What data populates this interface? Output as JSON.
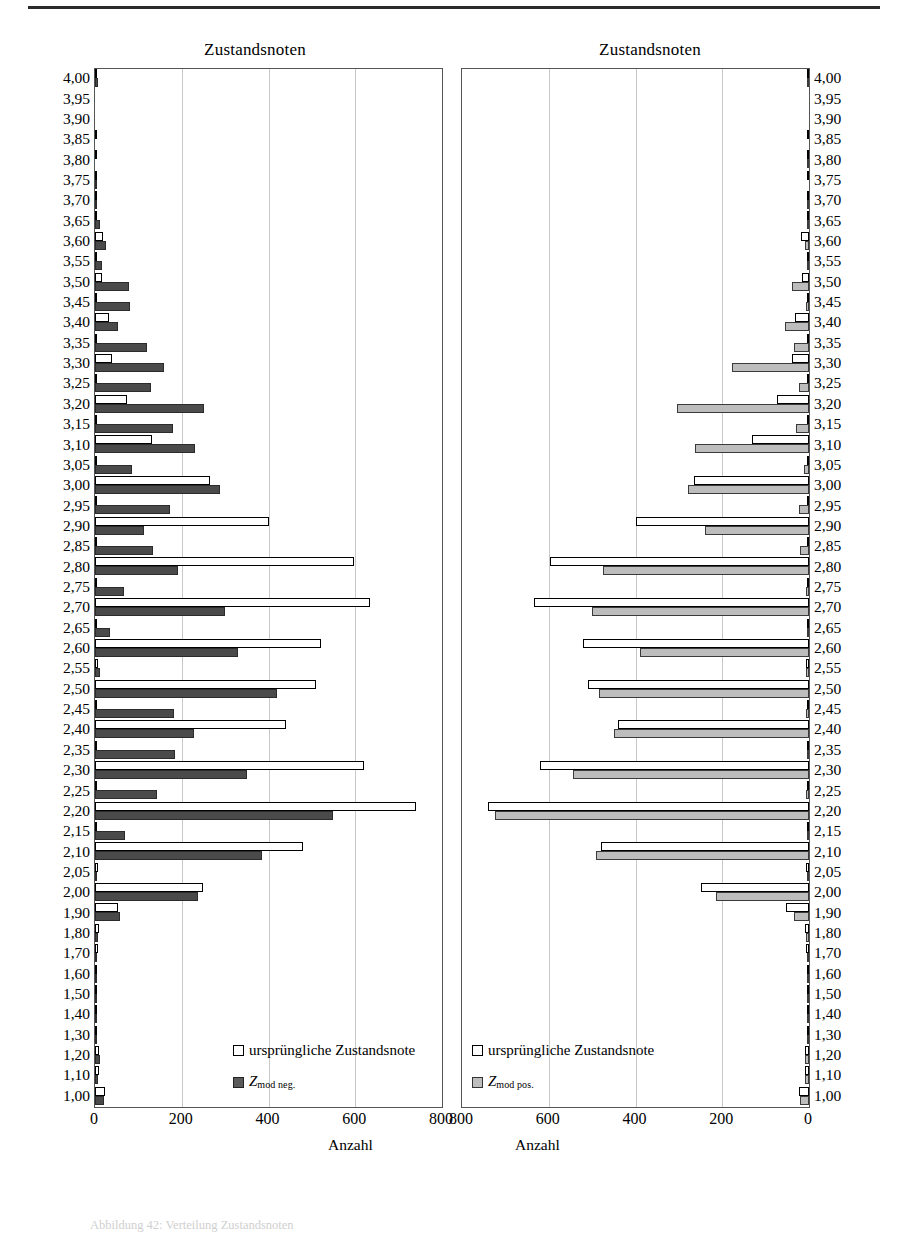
{
  "figure": {
    "top_rule": true,
    "caption": "Abbildung 42: Verteilung Zustandsnoten"
  },
  "panels": [
    {
      "id": "left",
      "title": "Zustandsnoten",
      "xlabel": "Anzahl",
      "xticks": [
        "0",
        "200",
        "400",
        "600",
        "800"
      ],
      "xlim": [
        0,
        800
      ],
      "direction": "ltr",
      "legend": [
        {
          "swatch": "orig",
          "label": "ursprüngliche Zustandsnote",
          "sub": ""
        },
        {
          "swatch": "neg",
          "label": "Z",
          "sub": "mod neg."
        }
      ]
    },
    {
      "id": "right",
      "title": "Zustandsnoten",
      "xlabel": "Anzahl",
      "xticks": [
        "800",
        "600",
        "400",
        "200",
        "0"
      ],
      "xlim": [
        0,
        800
      ],
      "direction": "rtl",
      "legend": [
        {
          "swatch": "orig",
          "label": "ursprüngliche Zustandsnote",
          "sub": ""
        },
        {
          "swatch": "pos",
          "label": "Z",
          "sub": "mod pos."
        }
      ]
    }
  ],
  "chart_data": {
    "type": "bar",
    "orientation": "horizontal",
    "title": "Zustandsnoten",
    "xlabel": "Anzahl",
    "ylabel": "Zustandsnote",
    "xlim": [
      0,
      800
    ],
    "grid": true,
    "legend_position": "inside-bottom",
    "categories": [
      "4,00",
      "3,95",
      "3,90",
      "3,85",
      "3,80",
      "3,75",
      "3,70",
      "3,65",
      "3,60",
      "3,55",
      "3,50",
      "3,45",
      "3,40",
      "3,35",
      "3,30",
      "3,25",
      "3,20",
      "3,15",
      "3,10",
      "3,05",
      "3,00",
      "2,95",
      "2,90",
      "2,85",
      "2,80",
      "2,75",
      "2,70",
      "2,65",
      "2,60",
      "2,55",
      "2,50",
      "2,45",
      "2,40",
      "2,35",
      "2,30",
      "2,25",
      "2,20",
      "2,15",
      "2,10",
      "2,05",
      "2,00",
      "1,90",
      "1,80",
      "1,70",
      "1,60",
      "1,50",
      "1,40",
      "1,30",
      "1,20",
      "1,10",
      "1,00"
    ],
    "series": [
      {
        "name": "ursprüngliche Zustandsnote",
        "panel": "left",
        "color": "#ffffff",
        "values": [
          4,
          0,
          0,
          3,
          4,
          3,
          4,
          5,
          18,
          5,
          16,
          2,
          33,
          4,
          40,
          4,
          74,
          3,
          132,
          4,
          265,
          3,
          400,
          2,
          598,
          3,
          633,
          2,
          521,
          6,
          509,
          3,
          440,
          2,
          620,
          3,
          740,
          3,
          480,
          8,
          248,
          52,
          9,
          6,
          2,
          1,
          5,
          4,
          9,
          10,
          22
        ]
      },
      {
        "name": "Z mod neg.",
        "panel": "left",
        "color": "#4a4a4a",
        "values": [
          6,
          0,
          0,
          0,
          0,
          4,
          5,
          12,
          25,
          16,
          78,
          80,
          52,
          120,
          160,
          128,
          252,
          180,
          230,
          85,
          288,
          172,
          113,
          134,
          192,
          68,
          300,
          35,
          330,
          12,
          420,
          183,
          228,
          185,
          350,
          143,
          548,
          70,
          385,
          5,
          238,
          58,
          7,
          5,
          1,
          1,
          3,
          3,
          11,
          8,
          20
        ]
      },
      {
        "name": "ursprüngliche Zustandsnote",
        "panel": "right",
        "color": "#ffffff",
        "values": [
          4,
          0,
          0,
          3,
          4,
          3,
          4,
          5,
          18,
          5,
          16,
          2,
          33,
          4,
          40,
          4,
          74,
          3,
          132,
          4,
          265,
          3,
          400,
          2,
          598,
          3,
          633,
          2,
          521,
          6,
          509,
          3,
          440,
          2,
          620,
          3,
          740,
          3,
          480,
          8,
          248,
          52,
          9,
          6,
          2,
          1,
          5,
          4,
          9,
          10,
          22
        ]
      },
      {
        "name": "Z mod pos.",
        "panel": "right",
        "color": "#bdbdbd",
        "values": [
          4,
          0,
          0,
          0,
          4,
          0,
          3,
          3,
          10,
          4,
          40,
          8,
          55,
          35,
          178,
          22,
          305,
          30,
          262,
          12,
          280,
          22,
          240,
          20,
          475,
          6,
          500,
          2,
          390,
          6,
          485,
          8,
          450,
          5,
          545,
          6,
          725,
          4,
          490,
          5,
          215,
          35,
          8,
          5,
          2,
          1,
          4,
          3,
          9,
          9,
          20
        ]
      }
    ]
  }
}
